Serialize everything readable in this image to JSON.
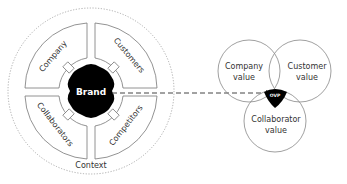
{
  "context_diagram": {
    "outer_label": "Context",
    "center_label": "Brand",
    "segments": [
      {
        "label": "Company",
        "position": "top-left"
      },
      {
        "label": "Customers",
        "position": "top-right"
      },
      {
        "label": "Collaborators",
        "position": "bottom-left"
      },
      {
        "label": "Competitors",
        "position": "bottom-right"
      }
    ]
  },
  "venn_diagram": {
    "circles": [
      {
        "line1": "Company",
        "line2": "value"
      },
      {
        "line1": "Customer",
        "line2": "value"
      },
      {
        "line1": "Collaborator",
        "line2": "value"
      }
    ],
    "intersection_label": "OVP"
  },
  "colors": {
    "line": "#888888",
    "fill_dark": "#000000",
    "text": "#333333"
  }
}
